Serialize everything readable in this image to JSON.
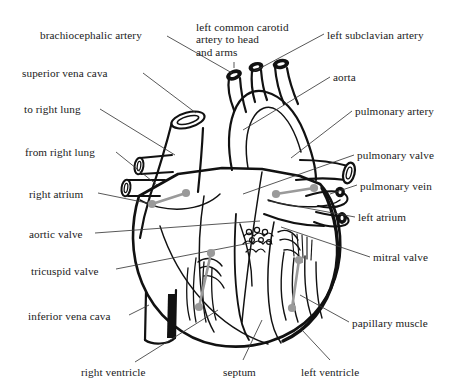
{
  "figure": {
    "type": "anatomical-line-diagram",
    "background_color": "#ffffff",
    "ink_color": "#1a1a1a",
    "marker_color": "#9a9a9a",
    "leader_line_color": "#3a3a3a"
  },
  "labels": [
    {
      "id": "brachiocephalic-artery",
      "text": "brachiocephalic artery",
      "x": 40,
      "y": 29,
      "align": "left",
      "lines": 1
    },
    {
      "id": "left-common-carotid",
      "text": "left common carotid\nartery to head\nand arms",
      "x": 196,
      "y": 21,
      "align": "left",
      "lines": 3
    },
    {
      "id": "left-subclavian-artery",
      "text": "left subclavian artery",
      "x": 327,
      "y": 29,
      "align": "left",
      "lines": 1
    },
    {
      "id": "superior-vena-cava",
      "text": "superior vena cava",
      "x": 22,
      "y": 67,
      "align": "left",
      "lines": 1
    },
    {
      "id": "aorta",
      "text": "aorta",
      "x": 333,
      "y": 71,
      "align": "left",
      "lines": 1
    },
    {
      "id": "to-right-lung",
      "text": "to right lung",
      "x": 24,
      "y": 103,
      "align": "left",
      "lines": 1
    },
    {
      "id": "pulmonary-artery",
      "text": "pulmonary artery",
      "x": 355,
      "y": 105,
      "align": "left",
      "lines": 1
    },
    {
      "id": "from-right-lung",
      "text": "from right lung",
      "x": 25,
      "y": 146,
      "align": "left",
      "lines": 1
    },
    {
      "id": "pulmonary-valve",
      "text": "pulmonary valve",
      "x": 357,
      "y": 149,
      "align": "left",
      "lines": 1
    },
    {
      "id": "pulmonary-vein",
      "text": "pulmonary vein",
      "x": 360,
      "y": 180,
      "align": "left",
      "lines": 1
    },
    {
      "id": "right-atrium",
      "text": "right atrium",
      "x": 29,
      "y": 188,
      "align": "left",
      "lines": 1
    },
    {
      "id": "left-atrium",
      "text": "left atrium",
      "x": 358,
      "y": 211,
      "align": "left",
      "lines": 1
    },
    {
      "id": "aortic-valve",
      "text": "aortic valve",
      "x": 29,
      "y": 228,
      "align": "left",
      "lines": 1
    },
    {
      "id": "mitral-valve",
      "text": "mitral valve",
      "x": 373,
      "y": 251,
      "align": "left",
      "lines": 1
    },
    {
      "id": "tricuspid-valve",
      "text": "tricuspid valve",
      "x": 31,
      "y": 265,
      "align": "left",
      "lines": 1
    },
    {
      "id": "inferior-vena-cava",
      "text": "inferior vena cava",
      "x": 28,
      "y": 310,
      "align": "left",
      "lines": 1
    },
    {
      "id": "papillary-muscle",
      "text": "papillary muscle",
      "x": 352,
      "y": 317,
      "align": "left",
      "lines": 1
    },
    {
      "id": "right-ventricle",
      "text": "right ventricle",
      "x": 81,
      "y": 366,
      "align": "left",
      "lines": 1
    },
    {
      "id": "septum",
      "text": "septum",
      "x": 223,
      "y": 366,
      "align": "left",
      "lines": 1
    },
    {
      "id": "left-ventricle",
      "text": "left ventricle",
      "x": 301,
      "y": 366,
      "align": "left",
      "lines": 1
    }
  ],
  "markers": [
    {
      "id": "right-atrium-marker",
      "x1": 152,
      "y1": 204,
      "x2": 186,
      "y2": 193
    },
    {
      "id": "left-atrium-marker",
      "x1": 276,
      "y1": 194,
      "x2": 314,
      "y2": 188
    },
    {
      "id": "right-ventricle-marker",
      "x1": 211,
      "y1": 253,
      "x2": 199,
      "y2": 307
    },
    {
      "id": "left-ventricle-marker",
      "x1": 299,
      "y1": 260,
      "x2": 292,
      "y2": 308
    }
  ],
  "leaders": [
    {
      "id": "leader-brachiocephalic",
      "points": "167,36 232,73"
    },
    {
      "id": "leader-left-carotid",
      "points": "234,62 234,68"
    },
    {
      "id": "leader-left-subclavian",
      "points": "324,34 253,72"
    },
    {
      "id": "leader-superior-vena-cava",
      "points": "143,73 196,113"
    },
    {
      "id": "leader-aorta",
      "points": "330,77 243,130"
    },
    {
      "id": "leader-to-right-lung",
      "points": "100,109 175,155"
    },
    {
      "id": "leader-pulmonary-artery",
      "points": "352,111 291,158"
    },
    {
      "id": "leader-from-right-lung",
      "points": "116,152 157,185"
    },
    {
      "id": "leader-pulmonary-valve",
      "points": "354,155 243,194"
    },
    {
      "id": "leader-pulmonary-vein",
      "points": "357,185 330,194"
    },
    {
      "id": "leader-right-atrium",
      "points": "98,193 152,204"
    },
    {
      "id": "leader-left-atrium",
      "points": "355,217 268,201"
    },
    {
      "id": "leader-aortic-valve",
      "points": "95,233 260,221"
    },
    {
      "id": "leader-mitral-valve",
      "points": "370,257 281,227"
    },
    {
      "id": "leader-tricuspid-valve",
      "points": "116,269 250,243"
    },
    {
      "id": "leader-inferior-vena-cava",
      "points": "129,315 149,305"
    },
    {
      "id": "leader-papillary-muscle",
      "points": "349,322 300,295"
    },
    {
      "id": "leader-right-ventricle",
      "points": "135,362 218,310"
    },
    {
      "id": "leader-septum",
      "points": "243,360 262,320"
    },
    {
      "id": "leader-left-ventricle",
      "points": "330,360 302,330"
    }
  ]
}
